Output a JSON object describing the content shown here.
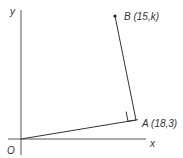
{
  "diagram": {
    "axes": {
      "x_label": "x",
      "y_label": "y",
      "origin_label": "O"
    },
    "points": {
      "A": {
        "label": "A (18,3)",
        "name": "A",
        "coords": [
          18,
          3
        ]
      },
      "B": {
        "label": "B (15,k)",
        "name": "B",
        "coords": [
          15,
          "k"
        ]
      }
    },
    "segments": [
      {
        "from": "O",
        "to": "A"
      },
      {
        "from": "A",
        "to": "B"
      }
    ],
    "annotations": {
      "right_angle_at": "A"
    },
    "colors": {
      "line": "#333333",
      "axis": "#555555",
      "background": "#ffffff"
    }
  }
}
